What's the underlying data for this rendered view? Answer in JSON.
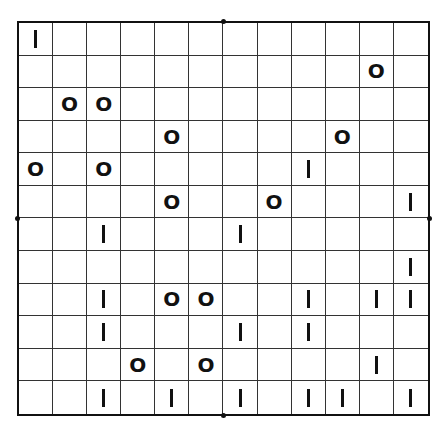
{
  "puzzle": {
    "type": "binary-takuzu",
    "rows": 12,
    "cols": 12,
    "symbols": {
      "zero": "O",
      "one": "I"
    },
    "grid": [
      [
        "1",
        "",
        "",
        "",
        "",
        "",
        "",
        "",
        "",
        "",
        "",
        ""
      ],
      [
        "",
        "",
        "",
        "",
        "",
        "",
        "",
        "",
        "",
        "",
        "0",
        ""
      ],
      [
        "",
        "0",
        "0",
        "",
        "",
        "",
        "",
        "",
        "",
        "",
        "",
        ""
      ],
      [
        "",
        "",
        "",
        "",
        "0",
        "",
        "",
        "",
        "",
        "0",
        "",
        ""
      ],
      [
        "0",
        "",
        "0",
        "",
        "",
        "",
        "",
        "",
        "1",
        "",
        "",
        ""
      ],
      [
        "",
        "",
        "",
        "",
        "0",
        "",
        "",
        "0",
        "",
        "",
        "",
        "1"
      ],
      [
        "",
        "",
        "1",
        "",
        "",
        "",
        "1",
        "",
        "",
        "",
        "",
        ""
      ],
      [
        "",
        "",
        "",
        "",
        "",
        "",
        "",
        "",
        "",
        "",
        "",
        "1"
      ],
      [
        "",
        "",
        "1",
        "",
        "0",
        "0",
        "",
        "",
        "1",
        "",
        "1",
        "1"
      ],
      [
        "",
        "",
        "1",
        "",
        "",
        "",
        "1",
        "",
        "1",
        "",
        "",
        ""
      ],
      [
        "",
        "",
        "",
        "0",
        "",
        "0",
        "",
        "",
        "",
        "",
        "1",
        ""
      ],
      [
        "",
        "",
        "1",
        "",
        "1",
        "",
        "1",
        "",
        "1",
        "1",
        "",
        "1"
      ]
    ]
  },
  "colors": {
    "background": "#ffffff",
    "grid_line": "#333333",
    "border": "#111111",
    "glyph": "#111111"
  }
}
